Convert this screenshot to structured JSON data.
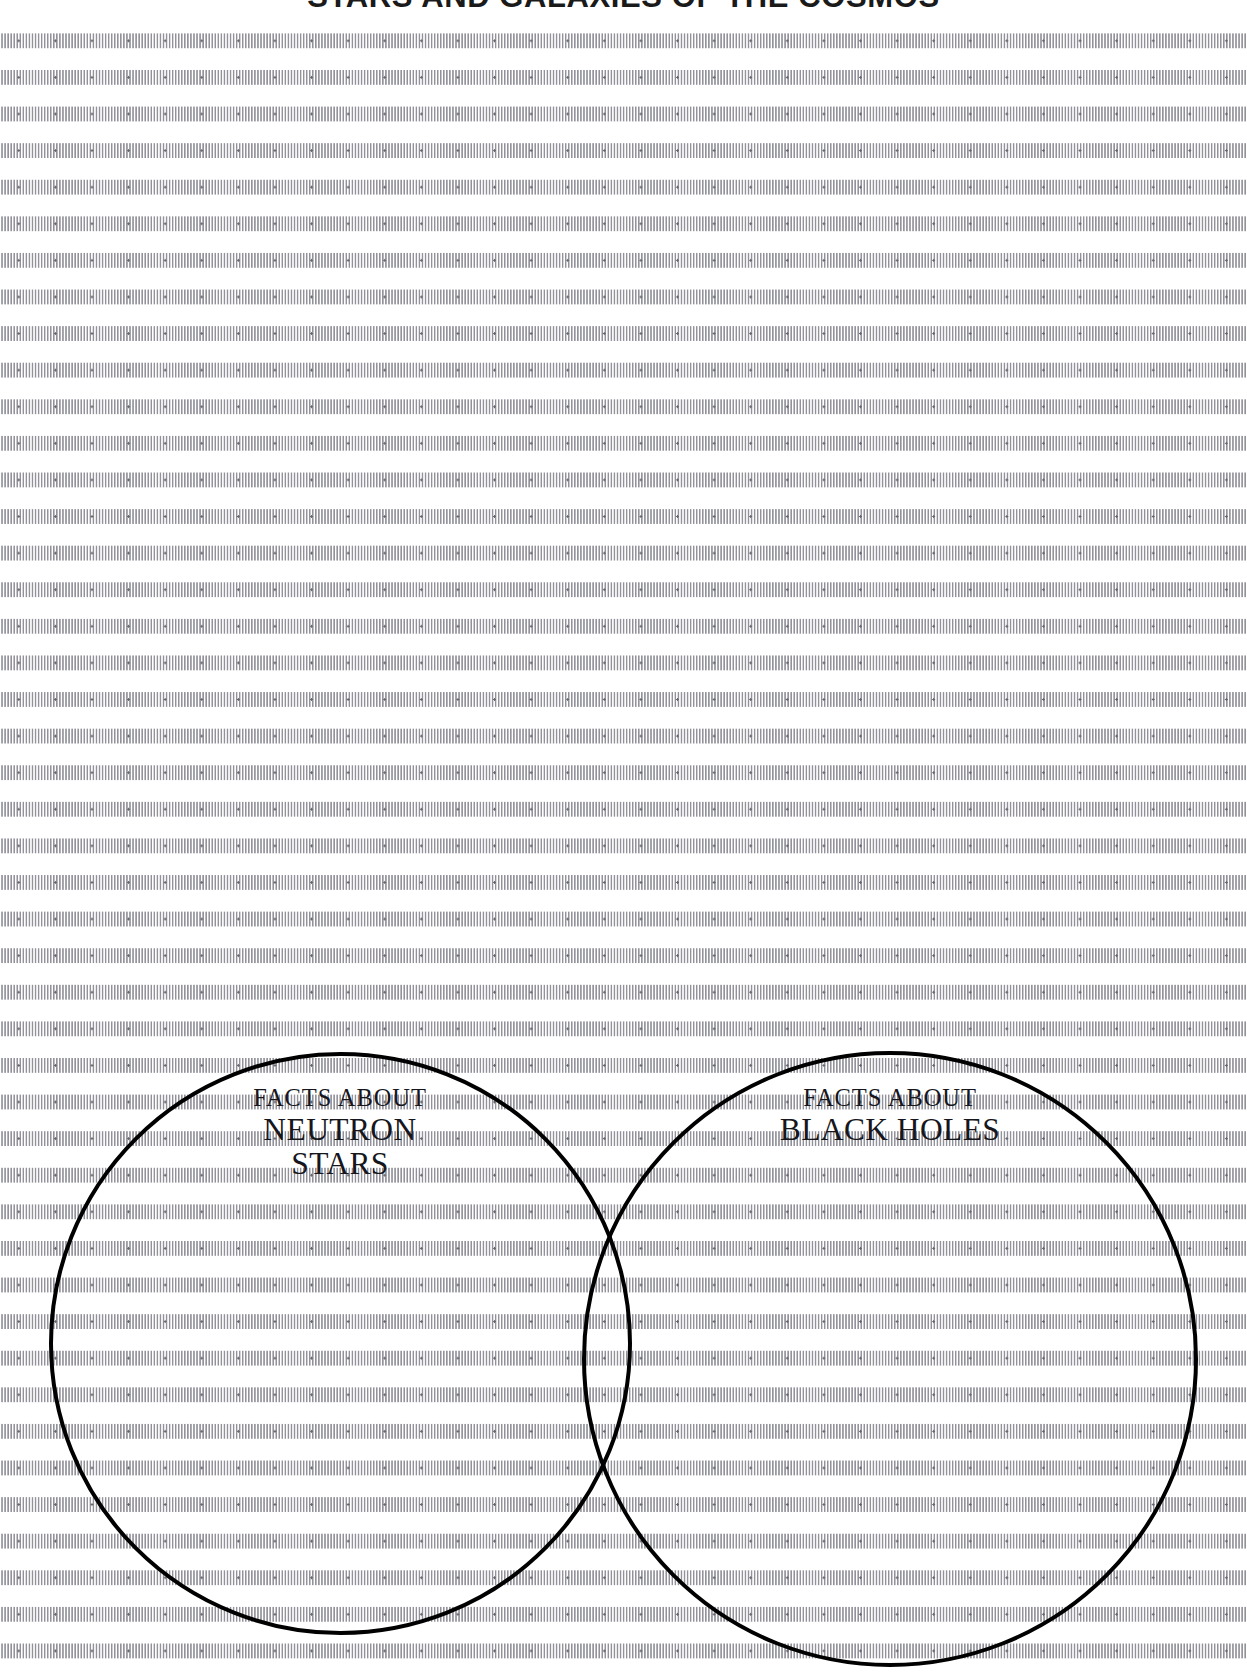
{
  "worksheet": {
    "title": "STARS AND GALAXIES OF THE COSMOS",
    "background": {
      "type": "dotted-grid-paper",
      "grid_spacing_px": 36.6,
      "dot_color": "#8d8d96",
      "paper_color": "#ffffff"
    },
    "diagram": {
      "type": "venn-diagram",
      "outline_color": "#000000",
      "outline_width_px": 4.5,
      "circles": [
        {
          "id": "left",
          "kicker": "FACTS ABOUT",
          "main": "NEUTRON STARS",
          "center_x": 340,
          "center_y": 1344,
          "radius": 291,
          "fill": "none"
        },
        {
          "id": "right",
          "kicker": "FACTS ABOUT",
          "main": "BLACK HOLES",
          "center_x": 890,
          "center_y": 1359,
          "radius": 308,
          "fill": "none"
        }
      ]
    }
  }
}
